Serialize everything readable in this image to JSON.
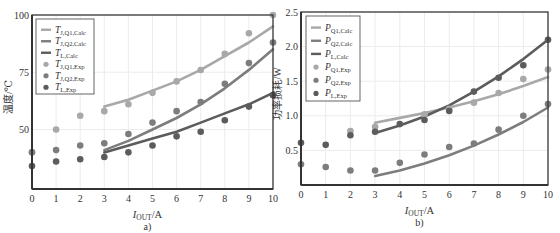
{
  "figure_header": "…",
  "chart_data": [
    {
      "id": "a",
      "type": "line+scatter",
      "caption": "a)",
      "xlabel": "I_OUT/A",
      "xlabel_main": "I",
      "xlabel_sub": "OUT",
      "xlabel_unit": "/A",
      "ylabel": "温度/℃",
      "xlim": [
        0,
        10
      ],
      "ylim": [
        24,
        100
      ],
      "xticks": [
        0,
        1,
        2,
        3,
        4,
        5,
        6,
        7,
        8,
        9,
        10
      ],
      "yticks": [
        50,
        75,
        100
      ],
      "grid": true,
      "legend_position": "upper left",
      "series": [
        {
          "name": "T_J,Q1,Calc",
          "label_main": "T",
          "label_sub": "J,Q1,Calc",
          "kind": "line",
          "color": "#a8a8a8",
          "x": [
            3,
            4,
            5,
            6,
            7,
            8,
            9,
            10
          ],
          "values": [
            60,
            63,
            67,
            71,
            76,
            82,
            88,
            95
          ]
        },
        {
          "name": "T_J,Q2,Calc",
          "label_main": "T",
          "label_sub": "J,Q2,Calc",
          "kind": "line",
          "color": "#7d7d7d",
          "x": [
            3,
            4,
            5,
            6,
            7,
            8,
            9,
            10
          ],
          "values": [
            41,
            45,
            50,
            55,
            61,
            68,
            76,
            85
          ]
        },
        {
          "name": "T_L,Calc",
          "label_main": "T",
          "label_sub": "L,Calc",
          "kind": "line",
          "color": "#5c5c5c",
          "x": [
            3,
            4,
            5,
            6,
            7,
            8,
            9,
            10
          ],
          "values": [
            40,
            43,
            46,
            49,
            53,
            57,
            61,
            66
          ]
        },
        {
          "name": "T_J,Q1,Exp",
          "label_main": "T",
          "label_sub": "J,Q1,Exp",
          "kind": "scatter",
          "color": "#a8a8a8",
          "x": [
            0,
            1,
            2,
            3,
            4,
            5,
            6,
            7,
            8,
            9,
            10
          ],
          "values": [
            40,
            50,
            56,
            58,
            61,
            66,
            71,
            76,
            83,
            92,
            100
          ]
        },
        {
          "name": "T_J,Q2,Exp",
          "label_main": "T",
          "label_sub": "J,Q2,Exp",
          "kind": "scatter",
          "color": "#7d7d7d",
          "x": [
            0,
            1,
            2,
            3,
            4,
            5,
            6,
            7,
            8,
            9,
            10
          ],
          "values": [
            40,
            41,
            43,
            44,
            48,
            53,
            58,
            62,
            70,
            79,
            88
          ]
        },
        {
          "name": "T_L,Exp",
          "label_main": "T",
          "label_sub": "L,Exp",
          "kind": "scatter",
          "color": "#5c5c5c",
          "x": [
            0,
            1,
            2,
            3,
            4,
            5,
            6,
            7,
            8,
            9,
            10
          ],
          "values": [
            34,
            36,
            37,
            38,
            40,
            43,
            47,
            49,
            54,
            60,
            65
          ]
        }
      ]
    },
    {
      "id": "b",
      "type": "line+scatter",
      "caption": "b)",
      "xlabel": "I_OUT/A",
      "xlabel_main": "I",
      "xlabel_sub": "OUT",
      "xlabel_unit": "/A",
      "ylabel": "功率损耗/W",
      "xlim": [
        0,
        10
      ],
      "ylim": [
        0,
        2.5
      ],
      "xticks": [
        0,
        1,
        2,
        3,
        4,
        5,
        6,
        7,
        8,
        9,
        10
      ],
      "yticks": [
        0.5,
        1.0,
        1.5,
        2.0,
        2.5
      ],
      "grid": true,
      "legend_position": "upper left",
      "series": [
        {
          "name": "P_Q1,Calc",
          "label_main": "P",
          "label_sub": "Q1,Calc",
          "kind": "line",
          "color": "#a8a8a8",
          "x": [
            3,
            4,
            5,
            6,
            7,
            8,
            9,
            10
          ],
          "values": [
            0.9,
            0.97,
            1.04,
            1.12,
            1.21,
            1.31,
            1.43,
            1.56
          ]
        },
        {
          "name": "P_Q2,Calc",
          "label_main": "P",
          "label_sub": "Q2,Calc",
          "kind": "line",
          "color": "#7d7d7d",
          "x": [
            3,
            4,
            5,
            6,
            7,
            8,
            9,
            10
          ],
          "values": [
            0.13,
            0.21,
            0.31,
            0.43,
            0.57,
            0.73,
            0.91,
            1.12
          ]
        },
        {
          "name": "P_L,Calc",
          "label_main": "P",
          "label_sub": "L,Calc",
          "kind": "line",
          "color": "#5c5c5c",
          "x": [
            3,
            4,
            5,
            6,
            7,
            8,
            9,
            10
          ],
          "values": [
            0.75,
            0.86,
            0.99,
            1.15,
            1.35,
            1.57,
            1.82,
            2.1
          ]
        },
        {
          "name": "P_Q1,Exp",
          "label_main": "P",
          "label_sub": "Q1,Exp",
          "kind": "scatter",
          "color": "#a8a8a8",
          "x": [
            2,
            3,
            5,
            6,
            7,
            8,
            9,
            10
          ],
          "values": [
            0.78,
            0.84,
            1.02,
            1.1,
            1.19,
            1.33,
            1.53,
            1.67
          ]
        },
        {
          "name": "P_Q2,Exp",
          "label_main": "P",
          "label_sub": "Q2,Exp",
          "kind": "scatter",
          "color": "#7d7d7d",
          "x": [
            0,
            1,
            2,
            3,
            4,
            5,
            6,
            7,
            8,
            9,
            10
          ],
          "values": [
            0.3,
            0.26,
            0.21,
            0.21,
            0.32,
            0.44,
            0.55,
            0.6,
            0.8,
            1.0,
            1.17
          ]
        },
        {
          "name": "P_L,Exp",
          "label_main": "P",
          "label_sub": "L,Exp",
          "kind": "scatter",
          "color": "#5c5c5c",
          "x": [
            0,
            1,
            2,
            3,
            4,
            5,
            6,
            7,
            8,
            9,
            10
          ],
          "values": [
            0.61,
            0.58,
            0.72,
            0.77,
            0.88,
            0.94,
            1.07,
            1.35,
            1.55,
            1.73,
            2.1
          ]
        }
      ]
    }
  ],
  "layout": {
    "panels": [
      {
        "x0": 32,
        "x1": 273,
        "y0": 15,
        "y1": 189,
        "legend": {
          "x": 36,
          "y": 19,
          "w": 58,
          "h": 75
        }
      },
      {
        "x0": 301,
        "x1": 548,
        "y0": 12,
        "y1": 185,
        "legend": {
          "x": 306,
          "y": 16,
          "w": 54,
          "h": 85
        }
      }
    ]
  }
}
